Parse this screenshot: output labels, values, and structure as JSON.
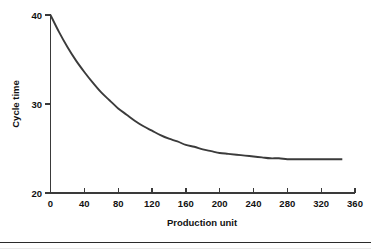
{
  "chart_data": {
    "type": "line",
    "title": "",
    "xlabel": "Production unit",
    "ylabel": "Cycle time",
    "xlim": [
      0,
      360
    ],
    "ylim": [
      20,
      40
    ],
    "xticks": [
      0,
      40,
      80,
      120,
      160,
      200,
      240,
      280,
      320,
      360
    ],
    "xtick_labels": [
      "0",
      "40",
      "80",
      "120",
      "160",
      "200",
      "240",
      "280",
      "320",
      "360"
    ],
    "yticks": [
      20,
      30,
      40
    ],
    "ytick_labels": [
      "20",
      "30",
      "40"
    ],
    "grid": false,
    "legend": false,
    "series": [
      {
        "name": "Cycle time",
        "color": "#3b3b3b",
        "x": [
          0,
          10,
          20,
          30,
          40,
          50,
          60,
          70,
          80,
          90,
          100,
          110,
          120,
          130,
          140,
          150,
          160,
          170,
          180,
          190,
          200,
          210,
          220,
          230,
          240,
          250,
          260,
          270,
          280,
          290,
          300,
          310,
          320,
          330,
          340,
          345
        ],
        "values": [
          40.0,
          38.1,
          36.4,
          34.9,
          33.6,
          32.4,
          31.3,
          30.4,
          29.5,
          28.8,
          28.1,
          27.5,
          27.0,
          26.5,
          26.1,
          25.8,
          25.4,
          25.2,
          24.9,
          24.7,
          24.5,
          24.4,
          24.3,
          24.2,
          24.1,
          24.0,
          23.9,
          23.9,
          23.8,
          23.8,
          23.8,
          23.8,
          23.8,
          23.8,
          23.8,
          23.8
        ]
      }
    ],
    "annotations": {
      "start_value": 40,
      "end_value": 24,
      "asymptote": 23.8,
      "curve_shape": "exponential decay"
    }
  },
  "figure": {
    "background_color": "#ffffff",
    "axis_color": "#3a3a3a",
    "text_color": "#111111"
  }
}
